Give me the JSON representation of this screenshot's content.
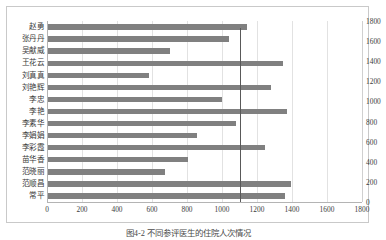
{
  "chart_data": {
    "type": "bar",
    "orientation": "horizontal",
    "title": "",
    "xlabel": "",
    "ylabel": "",
    "xlim": [
      0,
      1800
    ],
    "xticks": [
      0,
      200,
      400,
      600,
      800,
      1000,
      1200,
      1400,
      1600,
      1800
    ],
    "secondary_axis": {
      "position": "right",
      "ticks": [
        0,
        200,
        400,
        600,
        800,
        1000,
        1200,
        1400,
        1600,
        1800
      ],
      "lim": [
        0,
        1800
      ]
    },
    "grid": true,
    "legend": null,
    "bar_color": "#808080",
    "reference_line": {
      "value": 1100,
      "orientation": "vertical",
      "color": "#595959"
    },
    "categories": [
      "赵勇",
      "张丹丹",
      "吴献威",
      "王花云",
      "刘真真",
      "刘艳辉",
      "李忠",
      "李艳",
      "李素华",
      "李娟娟",
      "李彩霞",
      "苗华香",
      "范晓丽",
      "范顺昌",
      "常平"
    ],
    "values": [
      1140,
      1040,
      700,
      1350,
      580,
      1280,
      1000,
      1370,
      1080,
      855,
      1245,
      805,
      675,
      1395,
      1360
    ]
  },
  "caption": {
    "text": "图4-2  不同参评医生的住院人次情况"
  }
}
